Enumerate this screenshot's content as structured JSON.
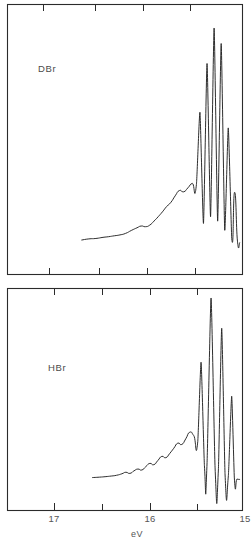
{
  "figure": {
    "axis_title": "eV",
    "line_color": "#232323",
    "frame_color": "#2b2b2b",
    "background": "#ffffff"
  },
  "chart_data": [
    {
      "type": "line",
      "title": "DBr",
      "panel": "top",
      "xlabel": "eV",
      "ylabel": "",
      "xlim": [
        17.45,
        14.85
      ],
      "x_axis_reversed": true,
      "grid": false,
      "legend": "none",
      "tick_labels": [],
      "minor_ticks_ev": [
        17.0,
        16.5,
        16.0,
        15.5
      ],
      "annotations": [
        {
          "text": "DBr",
          "x_ev": 17.0,
          "position": "upper-left"
        }
      ],
      "peaks": [
        {
          "label": "v0",
          "x_ev": 15.43,
          "rel_height": 0.62
        },
        {
          "label": "v1",
          "x_ev": 15.33,
          "rel_height": 0.84
        },
        {
          "label": "v2",
          "x_ev": 15.23,
          "rel_height": 1.0
        },
        {
          "label": "v3",
          "x_ev": 15.13,
          "rel_height": 0.93
        },
        {
          "label": "v4",
          "x_ev": 15.03,
          "rel_height": 0.55
        },
        {
          "label": "v5",
          "x_ev": 14.94,
          "rel_height": 0.26
        }
      ],
      "series": [
        {
          "name": "DBr photoelectron intensity",
          "x": [
            17.1,
            17.0,
            16.9,
            16.8,
            16.72,
            16.64,
            16.56,
            16.48,
            16.4,
            16.32,
            16.26,
            16.2,
            16.14,
            16.08,
            16.02,
            15.96,
            15.9,
            15.84,
            15.78,
            15.72,
            15.66,
            15.6,
            15.54,
            15.48,
            15.43,
            15.38,
            15.33,
            15.28,
            15.23,
            15.18,
            15.13,
            15.08,
            15.03,
            14.98,
            14.94,
            14.9,
            14.87
          ],
          "values": [
            0.045,
            0.05,
            0.052,
            0.057,
            0.06,
            0.064,
            0.068,
            0.075,
            0.088,
            0.1,
            0.108,
            0.105,
            0.112,
            0.13,
            0.15,
            0.172,
            0.196,
            0.215,
            0.244,
            0.268,
            0.262,
            0.28,
            0.3,
            0.295,
            0.62,
            0.12,
            0.84,
            0.15,
            1.0,
            0.13,
            0.93,
            0.09,
            0.55,
            0.05,
            0.26,
            0.04,
            0.035
          ]
        }
      ]
    },
    {
      "type": "line",
      "title": "HBr",
      "panel": "bottom",
      "xlabel": "eV",
      "ylabel": "",
      "xlim": [
        17.45,
        14.85
      ],
      "x_axis_reversed": true,
      "grid": false,
      "legend": "none",
      "tick_labels": [
        {
          "value": 17,
          "text": "17"
        },
        {
          "value": 16,
          "text": "16"
        },
        {
          "value": 15,
          "text": "15"
        }
      ],
      "minor_ticks_ev": [
        17.0,
        16.5,
        16.0,
        15.5
      ],
      "annotations": [
        {
          "text": "HBr",
          "x_ev": 16.95,
          "position": "upper-left"
        }
      ],
      "peaks": [
        {
          "label": "v0",
          "x_ev": 15.45,
          "rel_height": 0.66
        },
        {
          "label": "v1",
          "x_ev": 15.3,
          "rel_height": 1.0
        },
        {
          "label": "v2",
          "x_ev": 15.14,
          "rel_height": 0.84
        },
        {
          "label": "v3",
          "x_ev": 14.99,
          "rel_height": 0.48
        }
      ],
      "series": [
        {
          "name": "HBr photoelectron intensity",
          "x": [
            17.08,
            16.98,
            16.88,
            16.8,
            16.72,
            16.64,
            16.58,
            16.52,
            16.46,
            16.4,
            16.34,
            16.28,
            16.22,
            16.16,
            16.1,
            16.04,
            15.98,
            15.92,
            15.86,
            15.8,
            15.74,
            15.68,
            15.62,
            15.56,
            15.5,
            15.45,
            15.4,
            15.36,
            15.3,
            15.24,
            15.19,
            15.14,
            15.09,
            15.04,
            14.99,
            14.95,
            14.91,
            14.87
          ],
          "values": [
            0.05,
            0.052,
            0.055,
            0.058,
            0.062,
            0.07,
            0.078,
            0.072,
            0.085,
            0.095,
            0.09,
            0.108,
            0.125,
            0.118,
            0.14,
            0.162,
            0.155,
            0.178,
            0.205,
            0.232,
            0.225,
            0.255,
            0.29,
            0.272,
            0.24,
            0.66,
            0.115,
            0.13,
            1.0,
            0.105,
            0.09,
            0.84,
            0.07,
            0.06,
            0.48,
            0.048,
            0.042,
            0.04
          ]
        }
      ]
    }
  ]
}
